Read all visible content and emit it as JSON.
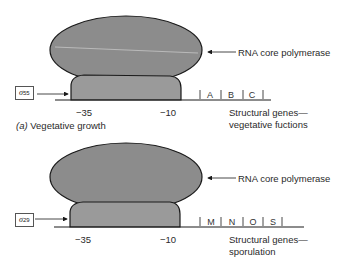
{
  "colors": {
    "core_fill": "#8c8c8c",
    "sigma_fill": "#9a9a9a",
    "outline": "#1a1a1a",
    "text": "#2a2a2a"
  },
  "panel_a": {
    "sigma_symbol": "σ",
    "sigma_number": "55",
    "core_label": "RNA core polymerase",
    "pos_35": "−35",
    "pos_10": "−10",
    "genes": [
      "A",
      "B",
      "C"
    ],
    "genes_label_line1": "Structural genes—",
    "genes_label_line2": "vegetative fuctions",
    "caption_letter": "(a)",
    "caption_text": "Vegetative growth"
  },
  "panel_b": {
    "sigma_symbol": "σ",
    "sigma_number": "29",
    "core_label": "RNA core polymerase",
    "pos_35": "−35",
    "pos_10": "−10",
    "genes": [
      "M",
      "N",
      "O",
      "S"
    ],
    "genes_label_line1": "Structural genes—",
    "genes_label_line2": "sporulation"
  }
}
